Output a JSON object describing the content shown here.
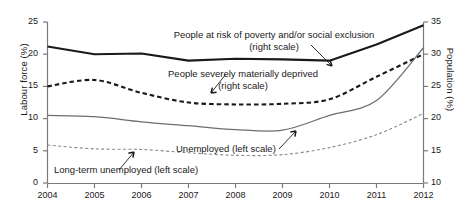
{
  "chart_data": {
    "type": "line",
    "title": "",
    "xlabel": "",
    "ylabel": "Labour force (%)",
    "ylabel_right": "Population (%)",
    "categories": [
      "2004",
      "2005",
      "2006",
      "2007",
      "2008",
      "2009",
      "2010",
      "2011",
      "2012"
    ],
    "x": [
      2004,
      2005,
      2006,
      2007,
      2008,
      2009,
      2010,
      2011,
      2012
    ],
    "ylim": [
      0,
      25
    ],
    "yticks": [
      "0",
      "5",
      "10",
      "15",
      "20",
      "25"
    ],
    "ylim_right": [
      10,
      35
    ],
    "yticks_right": [
      "10",
      "15",
      "20",
      "25",
      "30",
      "35"
    ],
    "grid": false,
    "legend_position": "inline-annotations",
    "series": [
      {
        "name": "People at risk of poverty and/or social exclusion",
        "label": "People at risk of poverty and/or social exclusion",
        "scale_note": "(right scale)",
        "axis": "right",
        "style": "solid-thick",
        "color": "#1a1a1a",
        "values": [
          31.2,
          30.0,
          30.1,
          29.0,
          29.3,
          29.2,
          29.0,
          31.5,
          34.5
        ]
      },
      {
        "name": "People severely materially deprived",
        "label": "People severely materially deprived",
        "scale_note": "(right scale)",
        "axis": "right",
        "style": "dashed-thick",
        "color": "#1a1a1a",
        "values": [
          25.0,
          26.0,
          24.0,
          22.5,
          22.2,
          22.3,
          23.0,
          26.5,
          30.0
        ]
      },
      {
        "name": "Unemployed",
        "label": "Unemployed (left scale)",
        "scale_note": "(left scale)",
        "axis": "left",
        "style": "solid-thin",
        "color": "#6e6e6e",
        "values": [
          10.5,
          10.3,
          9.5,
          8.9,
          8.3,
          8.2,
          10.5,
          12.8,
          21.0
        ]
      },
      {
        "name": "Long-term unemployed",
        "label": "Long-term unemployed (left scale)",
        "scale_note": "(left scale)",
        "axis": "left",
        "style": "dashed-thin",
        "color": "#8a8a8a",
        "values": [
          5.9,
          5.3,
          5.2,
          4.7,
          4.3,
          4.4,
          5.5,
          7.5,
          10.8
        ]
      }
    ],
    "annotations": [
      {
        "text": "People at risk of poverty and/or social exclusion",
        "subtext": "(right scale)",
        "target_series": "People at risk of poverty and/or social exclusion"
      },
      {
        "text": "People severely materially deprived",
        "subtext": "(right scale)",
        "target_series": "People severely materially deprived"
      },
      {
        "text": "Unemployed (left scale)",
        "subtext": "",
        "target_series": "Unemployed"
      },
      {
        "text": "Long-term unemployed (left scale)",
        "subtext": "",
        "target_series": "Long-term unemployed"
      }
    ]
  },
  "axes": {
    "left": {
      "title": "Labour force (%)",
      "ticks": [
        "25",
        "20",
        "15",
        "10",
        "5",
        "0"
      ]
    },
    "right": {
      "title": "Population (%)",
      "ticks": [
        "35",
        "30",
        "25",
        "20",
        "15",
        "10"
      ]
    },
    "bottom": {
      "ticks": [
        "2004",
        "2005",
        "2006",
        "2007",
        "2008",
        "2009",
        "2010",
        "2011",
        "2012"
      ]
    }
  },
  "labels": {
    "poverty_line1": "People at risk of poverty and/or social exclusion",
    "poverty_line2": "(right scale)",
    "deprived_line1": "People severely materially deprived",
    "deprived_line2": "(right scale)",
    "unemployed": "Unemployed (left scale)",
    "longterm": "Long-term unemployed (left scale)"
  },
  "colors": {
    "background": "#ffffff",
    "axis": "#6e6e6e",
    "text": "#1a1a1a",
    "poverty": "#1a1a1a",
    "deprived": "#1a1a1a",
    "unemployed": "#6e6e6e",
    "longterm": "#8a8a8a"
  }
}
